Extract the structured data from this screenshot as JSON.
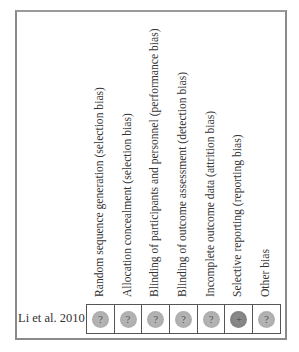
{
  "domains": [
    {
      "label": "Random sequence generation (selection bias)"
    },
    {
      "label": "Allocation concealment (selection bias)"
    },
    {
      "label": "Blinding of participants and personnel (performance bias)"
    },
    {
      "label": "Blinding of outcome assessment (detection bias)"
    },
    {
      "label": "Incomplete outcome data (attrition bias)"
    },
    {
      "label": "Selective reporting (reporting bias)"
    },
    {
      "label": "Other bias"
    }
  ],
  "studies": [
    {
      "name": "Li et al. 2010",
      "judgements": [
        {
          "symbol": "?",
          "risk": "unclear"
        },
        {
          "symbol": "?",
          "risk": "unclear"
        },
        {
          "symbol": "?",
          "risk": "unclear"
        },
        {
          "symbol": "?",
          "risk": "unclear"
        },
        {
          "symbol": "?",
          "risk": "unclear"
        },
        {
          "symbol": "+",
          "risk": "low"
        },
        {
          "symbol": "?",
          "risk": "unclear"
        }
      ]
    }
  ],
  "colors": {
    "unclear": "#b0b0b0",
    "low": "#858585",
    "grid": "#555555",
    "frame": "#8a8a8a"
  }
}
